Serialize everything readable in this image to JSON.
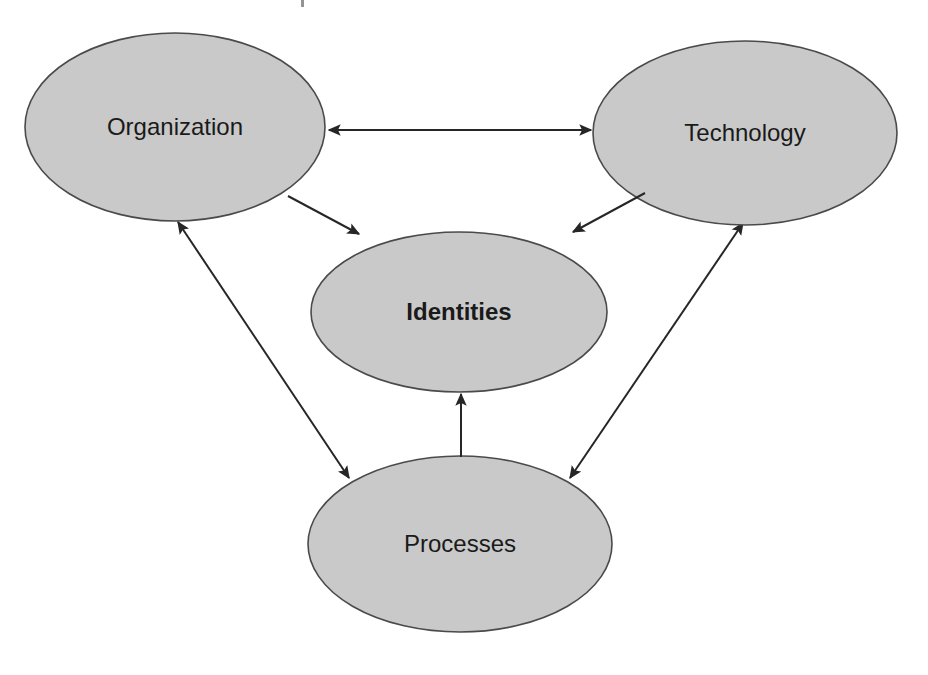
{
  "diagram": {
    "background_color": "#ffffff",
    "node_fill_color": "#c9c9c9",
    "node_stroke_color": "#4a4a4a",
    "edge_color": "#262626",
    "label_color": "#1a1a1a",
    "nodes": [
      {
        "id": "organization",
        "label": "Organization",
        "shape": "ellipse",
        "emphasis": "normal",
        "cx": 175,
        "cy": 127,
        "rx": 150,
        "ry": 94
      },
      {
        "id": "technology",
        "label": "Technology",
        "shape": "ellipse",
        "emphasis": "normal",
        "cx": 745,
        "cy": 133,
        "rx": 152,
        "ry": 92
      },
      {
        "id": "identities",
        "label": "Identities",
        "shape": "ellipse",
        "emphasis": "bold",
        "cx": 459,
        "cy": 312,
        "rx": 148,
        "ry": 80
      },
      {
        "id": "processes",
        "label": "Processes",
        "shape": "ellipse",
        "emphasis": "normal",
        "cx": 460,
        "cy": 544,
        "rx": 152,
        "ry": 88
      }
    ],
    "edges": [
      {
        "id": "organization-technology",
        "from": "organization",
        "to": "technology",
        "direction": "bidirectional",
        "x1": 329,
        "y1": 130,
        "x2": 591,
        "y2": 130
      },
      {
        "id": "organization-identities",
        "from": "organization",
        "to": "identities",
        "direction": "forward",
        "x1": 288,
        "y1": 196,
        "x2": 359,
        "y2": 234
      },
      {
        "id": "technology-identities",
        "from": "technology",
        "to": "identities",
        "direction": "forward",
        "x1": 645,
        "y1": 193,
        "x2": 573,
        "y2": 232
      },
      {
        "id": "organization-processes",
        "from": "organization",
        "to": "processes",
        "direction": "bidirectional",
        "x1": 178,
        "y1": 222,
        "x2": 349,
        "y2": 478
      },
      {
        "id": "technology-processes",
        "from": "technology",
        "to": "processes",
        "direction": "bidirectional",
        "x1": 743,
        "y1": 223,
        "x2": 570,
        "y2": 478
      },
      {
        "id": "processes-identities",
        "from": "processes",
        "to": "identities",
        "direction": "forward",
        "x1": 461,
        "y1": 457,
        "x2": 461,
        "y2": 394
      }
    ]
  }
}
